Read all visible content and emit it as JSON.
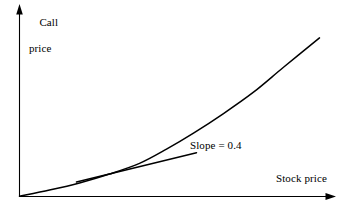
{
  "figure": {
    "background_color": "#ffffff",
    "ink_color": "#000000",
    "axes": {
      "y_axis": {
        "label_line1": "Call",
        "label_line2": "price",
        "icon": "arrow-up-icon"
      },
      "x_axis": {
        "label": "Stock price",
        "icon": "arrow-right-icon"
      }
    },
    "annotations": {
      "slope_label": "Slope = 0.4"
    }
  },
  "chart_data": {
    "type": "line",
    "title": "",
    "xlabel": "Stock price",
    "ylabel": "Call price",
    "grid": false,
    "legend": null,
    "axis_style": "arrow-headed, unlabeled ticks, origin at bottom-left",
    "xlim": [
      0,
      1
    ],
    "ylim": [
      0,
      1
    ],
    "series": [
      {
        "name": "Call price curve",
        "description": "Convex increasing option value curve rising from the origin",
        "x": [
          0.0,
          0.1,
          0.2,
          0.3,
          0.4,
          0.49,
          0.58,
          0.68,
          0.78,
          0.88,
          1.0
        ],
        "y": [
          0.0,
          0.035,
          0.075,
          0.125,
          0.185,
          0.265,
          0.355,
          0.465,
          0.585,
          0.725,
          0.89
        ]
      },
      {
        "name": "Tangent line",
        "description": "Straight tangent touching the curve, illustrating the option delta",
        "x": [
          0.19,
          0.36,
          0.49,
          0.59
        ],
        "y": [
          0.08,
          0.145,
          0.2,
          0.245
        ],
        "slope": 0.4
      }
    ],
    "annotations": [
      {
        "text": "Slope = 0.4",
        "x": 0.55,
        "y": 0.29
      }
    ]
  }
}
